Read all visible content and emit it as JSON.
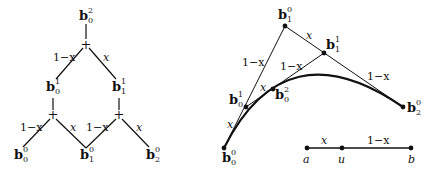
{
  "left_tree": {
    "nodes": {
      "b02": {
        "base": "b",
        "sub": "0",
        "sup": "2"
      },
      "b01": {
        "base": "b",
        "sub": "0",
        "sup": "1"
      },
      "b11": {
        "base": "b",
        "sub": "1",
        "sup": "1"
      },
      "b00": {
        "base": "b",
        "sub": "0",
        "sup": "0"
      },
      "b10": {
        "base": "b",
        "sub": "1",
        "sup": "0"
      },
      "b20": {
        "base": "b",
        "sub": "2",
        "sup": "0"
      }
    },
    "plus": "+",
    "weights": {
      "top_left": "1−x",
      "top_right": "x",
      "mid_left_left": "1−x",
      "mid_left_right": "x",
      "mid_right_left": "1−x",
      "mid_right_right": "x"
    }
  },
  "right_construction": {
    "points": {
      "b00": {
        "base": "b",
        "sub": "0",
        "sup": "0"
      },
      "b10": {
        "base": "b",
        "sub": "1",
        "sup": "0"
      },
      "b20": {
        "base": "b",
        "sub": "2",
        "sup": "0"
      },
      "b01": {
        "base": "b",
        "sub": "0",
        "sup": "1"
      },
      "b11": {
        "base": "b",
        "sub": "1",
        "sup": "1"
      },
      "b02": {
        "base": "b",
        "sub": "0",
        "sup": "2"
      }
    },
    "weights": {
      "b00_b01": "x",
      "b01_b10": "1−x",
      "b10_b11": "x",
      "b11_b20": "1−x",
      "b01_b02": "x",
      "b02_b11": "1−x"
    }
  },
  "parameter_line": {
    "a": "a",
    "u": "u",
    "b": "b",
    "seg1": "x",
    "seg2": "1−x"
  }
}
